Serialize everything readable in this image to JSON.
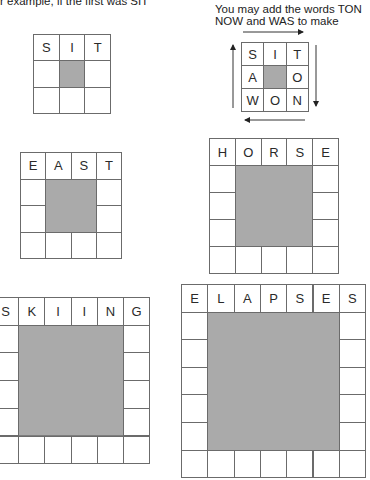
{
  "intro_text": "r example, if the first was SIT",
  "note": {
    "line1": "You may add the words TON",
    "line2": "NOW and WAS to make"
  },
  "puzzles": [
    {
      "id": "sit",
      "size": 3,
      "top_word": "SIT",
      "letters": [
        "S",
        "I",
        "T"
      ]
    },
    {
      "id": "example",
      "size": 3,
      "rows": [
        [
          "S",
          "I",
          "T"
        ],
        [
          "A",
          "",
          "O"
        ],
        [
          "W",
          "O",
          "N"
        ]
      ],
      "arrows": [
        "right-top",
        "down-right",
        "left-bottom",
        "up-left"
      ]
    },
    {
      "id": "east",
      "size": 4,
      "top_word": "EAST",
      "letters": [
        "E",
        "A",
        "S",
        "T"
      ]
    },
    {
      "id": "horse",
      "size": 5,
      "top_word": "HORSE",
      "letters": [
        "H",
        "O",
        "R",
        "S",
        "E"
      ]
    },
    {
      "id": "skiing",
      "size": 6,
      "top_word": "SKIING",
      "letters": [
        "S",
        "K",
        "I",
        "I",
        "N",
        "G"
      ]
    },
    {
      "id": "elapses",
      "size": 7,
      "top_word": "ELAPSES",
      "letters": [
        "E",
        "L",
        "A",
        "P",
        "S",
        "E",
        "S"
      ]
    }
  ],
  "colors": {
    "shade": "#aaaaaa",
    "border": "#6b6b6b",
    "text": "#2a2a2a"
  }
}
